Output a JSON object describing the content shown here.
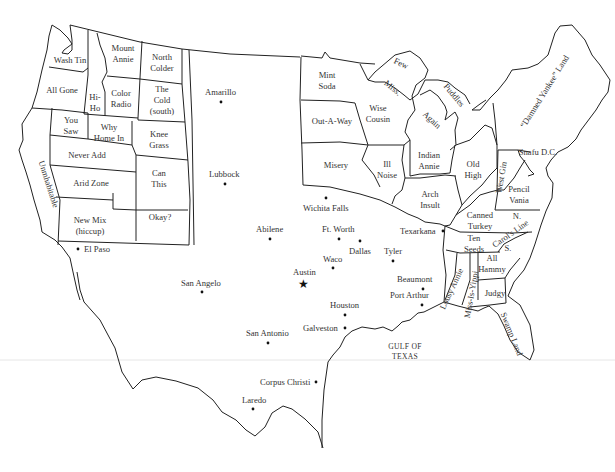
{
  "map": {
    "title": "Texan's view of the United States",
    "regions": [
      {
        "id": "wash-tin",
        "label": "Wash Tin",
        "x": 70,
        "y": 63
      },
      {
        "id": "all-gone",
        "label": "All Gone",
        "x": 62,
        "y": 93
      },
      {
        "id": "hi-ho-1",
        "label": "Hi-",
        "x": 95,
        "y": 100
      },
      {
        "id": "hi-ho-2",
        "label": "Ho",
        "x": 95,
        "y": 111
      },
      {
        "id": "mount-annie-1",
        "label": "Mount",
        "x": 123,
        "y": 51
      },
      {
        "id": "mount-annie-2",
        "label": "Annie",
        "x": 123,
        "y": 62
      },
      {
        "id": "north-colder-1",
        "label": "North",
        "x": 162,
        "y": 60
      },
      {
        "id": "north-colder-2",
        "label": "Colder",
        "x": 162,
        "y": 71
      },
      {
        "id": "color-radio-1",
        "label": "Color",
        "x": 121,
        "y": 96
      },
      {
        "id": "color-radio-2",
        "label": "Radio",
        "x": 121,
        "y": 107
      },
      {
        "id": "the-cold-south-1",
        "label": "The",
        "x": 162,
        "y": 92
      },
      {
        "id": "the-cold-south-2",
        "label": "Cold",
        "x": 162,
        "y": 103
      },
      {
        "id": "the-cold-south-3",
        "label": "(south)",
        "x": 162,
        "y": 114
      },
      {
        "id": "you-saw-1",
        "label": "You",
        "x": 71,
        "y": 123
      },
      {
        "id": "you-saw-2",
        "label": "Saw",
        "x": 71,
        "y": 134
      },
      {
        "id": "why-home-in-1",
        "label": "Why",
        "x": 109,
        "y": 130
      },
      {
        "id": "why-home-in-2",
        "label": "Home In",
        "x": 109,
        "y": 141
      },
      {
        "id": "knee-grass-1",
        "label": "Knee",
        "x": 159,
        "y": 137
      },
      {
        "id": "knee-grass-2",
        "label": "Grass",
        "x": 159,
        "y": 148
      },
      {
        "id": "never-add",
        "label": "Never Add",
        "x": 87,
        "y": 158
      },
      {
        "id": "arid-zone",
        "label": "Arid Zone",
        "x": 91,
        "y": 186
      },
      {
        "id": "can-this-1",
        "label": "Can",
        "x": 159,
        "y": 176
      },
      {
        "id": "can-this-2",
        "label": "This",
        "x": 159,
        "y": 187
      },
      {
        "id": "okay",
        "label": "Okay?",
        "x": 160,
        "y": 220
      },
      {
        "id": "new-mix-1",
        "label": "New Mix",
        "x": 90,
        "y": 223
      },
      {
        "id": "new-mix-2",
        "label": "(hiccup)",
        "x": 90,
        "y": 234
      },
      {
        "id": "mint-soda-1",
        "label": "Mint",
        "x": 327,
        "y": 78
      },
      {
        "id": "mint-soda-2",
        "label": "Soda",
        "x": 327,
        "y": 89
      },
      {
        "id": "out-a-way",
        "label": "Out-A-Way",
        "x": 332,
        "y": 124
      },
      {
        "id": "misery",
        "label": "Misery",
        "x": 336,
        "y": 168
      },
      {
        "id": "wise-cousin-1",
        "label": "Wise",
        "x": 378,
        "y": 111
      },
      {
        "id": "wise-cousin-2",
        "label": "Cousin",
        "x": 378,
        "y": 122
      },
      {
        "id": "ill-noise-1",
        "label": "Ill",
        "x": 387,
        "y": 167
      },
      {
        "id": "ill-noise-2",
        "label": "Noise",
        "x": 387,
        "y": 178
      },
      {
        "id": "indian-annie-1",
        "label": "Indian",
        "x": 429,
        "y": 158
      },
      {
        "id": "indian-annie-2",
        "label": "Annie",
        "x": 429,
        "y": 169
      },
      {
        "id": "arch-insult-1",
        "label": "Arch",
        "x": 430,
        "y": 197
      },
      {
        "id": "arch-insult-2",
        "label": "Insult",
        "x": 430,
        "y": 208
      },
      {
        "id": "old-high-1",
        "label": "Old",
        "x": 473,
        "y": 167
      },
      {
        "id": "old-high-2",
        "label": "High",
        "x": 473,
        "y": 178
      },
      {
        "id": "pencil-vania-1",
        "label": "Pencil",
        "x": 519,
        "y": 192
      },
      {
        "id": "pencil-vania-2",
        "label": "Vania",
        "x": 519,
        "y": 203
      },
      {
        "id": "canned-turkey-1",
        "label": "Canned",
        "x": 480,
        "y": 218
      },
      {
        "id": "canned-turkey-2",
        "label": "Turkey",
        "x": 480,
        "y": 229
      },
      {
        "id": "carol-n",
        "label": "N.",
        "x": 517,
        "y": 219
      },
      {
        "id": "ten-seeds-1",
        "label": "Ten",
        "x": 474,
        "y": 241
      },
      {
        "id": "ten-seeds-2",
        "label": "Seeds",
        "x": 474,
        "y": 252
      },
      {
        "id": "carol-s",
        "label": "S.",
        "x": 508,
        "y": 251
      },
      {
        "id": "all-hammy-1",
        "label": "All",
        "x": 492,
        "y": 261
      },
      {
        "id": "all-hammy-2",
        "label": "Hammy",
        "x": 492,
        "y": 272
      },
      {
        "id": "judgy",
        "label": "Judgy",
        "x": 495,
        "y": 296
      },
      {
        "id": "snafu-dc",
        "label": "Snafu D.C.",
        "x": 538,
        "y": 155
      }
    ],
    "rotated_regions": [
      {
        "id": "unmhabitable",
        "label": "Unmhabitable",
        "x": 46,
        "y": 185,
        "rotate": 72
      },
      {
        "id": "few",
        "label": "Few",
        "x": 400,
        "y": 66,
        "rotate": 25
      },
      {
        "id": "miss",
        "label": "Miss.",
        "x": 391,
        "y": 90,
        "rotate": 40
      },
      {
        "id": "puddles",
        "label": "Puddles",
        "x": 452,
        "y": 97,
        "rotate": 50
      },
      {
        "id": "again",
        "label": "Again",
        "x": 430,
        "y": 122,
        "rotate": 42
      },
      {
        "id": "damned-yankee-land",
        "label": "“Damned Yankee” Land",
        "x": 547,
        "y": 93,
        "rotate": -58
      },
      {
        "id": "west-gin",
        "label": "West Gin",
        "x": 504,
        "y": 178,
        "rotate": -80
      },
      {
        "id": "carols-line",
        "label": "Carol's Line",
        "x": 512,
        "y": 236,
        "rotate": -35
      },
      {
        "id": "lousy-annie",
        "label": "Lousy Annie",
        "x": 454,
        "y": 290,
        "rotate": -65
      },
      {
        "id": "miss-is-yippi",
        "label": "Miss-Is-Yippi",
        "x": 474,
        "y": 295,
        "rotate": -80
      },
      {
        "id": "swamp-land",
        "label": "Swamp Land",
        "x": 509,
        "y": 335,
        "rotate": 68
      }
    ],
    "cities": [
      {
        "name": "Amarillo",
        "dot_x": 221,
        "dot_y": 102,
        "label_x": 205,
        "label_y": 95
      },
      {
        "name": "Lubbock",
        "dot_x": 225,
        "dot_y": 184,
        "label_x": 209,
        "label_y": 177
      },
      {
        "name": "Wichita Falls",
        "dot_x": 326,
        "dot_y": 198,
        "label_x": 303,
        "label_y": 211
      },
      {
        "name": "Abilene",
        "dot_x": 270,
        "dot_y": 239,
        "label_x": 256,
        "label_y": 232
      },
      {
        "name": "Ft. Worth",
        "dot_x": 339,
        "dot_y": 239,
        "label_x": 322,
        "label_y": 232
      },
      {
        "name": "Dallas",
        "dot_x": 360,
        "dot_y": 241,
        "label_x": 349,
        "label_y": 254
      },
      {
        "name": "Tyler",
        "dot_x": 393,
        "dot_y": 261,
        "label_x": 384,
        "label_y": 254
      },
      {
        "name": "Texarkana",
        "dot_x": 443,
        "dot_y": 231,
        "label_x": 400,
        "label_y": 234
      },
      {
        "name": "Waco",
        "dot_x": 333,
        "dot_y": 268,
        "label_x": 323,
        "label_y": 262
      },
      {
        "name": "Austin",
        "dot_x": 303,
        "dot_y": 284,
        "label_x": 293,
        "label_y": 275,
        "star": true
      },
      {
        "name": "San Angelo",
        "dot_x": 202,
        "dot_y": 292,
        "label_x": 181,
        "label_y": 286
      },
      {
        "name": "Beaumont",
        "dot_x": 423,
        "dot_y": 289,
        "label_x": 397,
        "label_y": 282
      },
      {
        "name": "Port Arthur",
        "dot_x": 422,
        "dot_y": 305,
        "label_x": 390,
        "label_y": 298
      },
      {
        "name": "Houston",
        "dot_x": 345,
        "dot_y": 315,
        "label_x": 330,
        "label_y": 308
      },
      {
        "name": "Galveston",
        "dot_x": 345,
        "dot_y": 328,
        "label_x": 303,
        "label_y": 331
      },
      {
        "name": "San Antonio",
        "dot_x": 268,
        "dot_y": 343,
        "label_x": 246,
        "label_y": 336
      },
      {
        "name": "Corpus Christi",
        "dot_x": 316,
        "dot_y": 382,
        "label_x": 260,
        "label_y": 385
      },
      {
        "name": "Laredo",
        "dot_x": 253,
        "dot_y": 409,
        "label_x": 242,
        "label_y": 403
      },
      {
        "name": "El Paso",
        "dot_x": 78,
        "dot_y": 249,
        "label_x": 84,
        "label_y": 252
      }
    ],
    "water": {
      "line1": "GULF OF",
      "line2": "TEXAS",
      "x": 405,
      "y": 349
    }
  }
}
